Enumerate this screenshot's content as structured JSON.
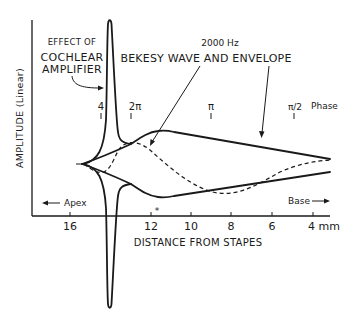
{
  "figure": {
    "y_axis_label": "AMPLITUDE (Linear)",
    "x_axis_label": "DISTANCE FROM STAPES",
    "x_ticks": [
      "16",
      "12",
      "10",
      "8",
      "6",
      "4 mm"
    ],
    "apex_label": "Apex",
    "base_label": "Base",
    "frequency_label": "2000 Hz",
    "wave_label": "BEKESY WAVE AND ENVELOPE",
    "amplifier_label_line1": "EFFECT OF",
    "amplifier_label_line2": "COCHLEAR",
    "amplifier_label_line3": "AMPLIFIER",
    "phase_label": "Phase",
    "phase_marks": [
      {
        "label": "4"
      },
      {
        "label": "2π"
      },
      {
        "label": "π"
      },
      {
        "label": "π/2"
      }
    ],
    "asterisk": "*"
  }
}
